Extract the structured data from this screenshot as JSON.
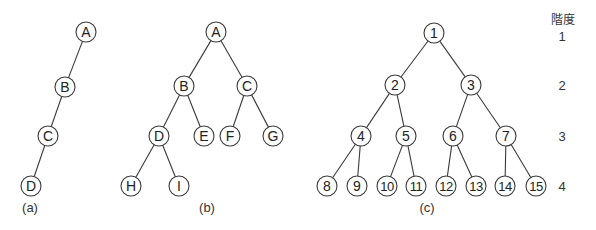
{
  "trees": [
    {
      "caption": "(a)",
      "nodes": [
        {
          "id": "A",
          "label": "A",
          "parent": null
        },
        {
          "id": "B",
          "label": "B",
          "parent": "A"
        },
        {
          "id": "C",
          "label": "C",
          "parent": "B"
        },
        {
          "id": "D",
          "label": "D",
          "parent": "C"
        }
      ]
    },
    {
      "caption": "(b)",
      "nodes": [
        {
          "id": "A",
          "label": "A",
          "parent": null
        },
        {
          "id": "B",
          "label": "B",
          "parent": "A"
        },
        {
          "id": "C",
          "label": "C",
          "parent": "A"
        },
        {
          "id": "D",
          "label": "D",
          "parent": "B"
        },
        {
          "id": "E",
          "label": "E",
          "parent": "B"
        },
        {
          "id": "F",
          "label": "F",
          "parent": "C"
        },
        {
          "id": "G",
          "label": "G",
          "parent": "C"
        },
        {
          "id": "H",
          "label": "H",
          "parent": "D"
        },
        {
          "id": "I",
          "label": "I",
          "parent": "D"
        }
      ]
    },
    {
      "caption": "(c)",
      "nodes": [
        {
          "id": "1",
          "label": "1",
          "parent": null
        },
        {
          "id": "2",
          "label": "2",
          "parent": "1"
        },
        {
          "id": "3",
          "label": "3",
          "parent": "1"
        },
        {
          "id": "4",
          "label": "4",
          "parent": "2"
        },
        {
          "id": "5",
          "label": "5",
          "parent": "2"
        },
        {
          "id": "6",
          "label": "6",
          "parent": "3"
        },
        {
          "id": "7",
          "label": "7",
          "parent": "3"
        },
        {
          "id": "8",
          "label": "8",
          "parent": "4"
        },
        {
          "id": "9",
          "label": "9",
          "parent": "4"
        },
        {
          "id": "10",
          "label": "10",
          "parent": "5"
        },
        {
          "id": "11",
          "label": "11",
          "parent": "5"
        },
        {
          "id": "12",
          "label": "12",
          "parent": "6"
        },
        {
          "id": "13",
          "label": "13",
          "parent": "6"
        },
        {
          "id": "14",
          "label": "14",
          "parent": "7"
        },
        {
          "id": "15",
          "label": "15",
          "parent": "7"
        }
      ]
    }
  ],
  "levels": {
    "header": "階度",
    "values": [
      "1",
      "2",
      "3",
      "4"
    ]
  }
}
